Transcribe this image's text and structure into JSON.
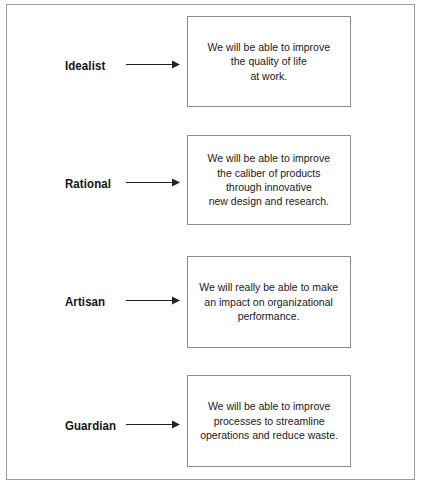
{
  "figure": {
    "width": 426,
    "height": 489,
    "background_color": "#ffffff",
    "frame_border_color": "#9a9a9a",
    "box_border_color": "#8d8d8d",
    "text_color": "#1a1a1a",
    "label_color": "#141414",
    "arrow_color": "#222222"
  },
  "rows": [
    {
      "label": "Idealist",
      "arrow_icon": "arrow-right-icon",
      "message": "We will be able to improve\nthe quality of life\nat work."
    },
    {
      "label": "Rational",
      "arrow_icon": "arrow-right-icon",
      "message": "We will be able to improve\nthe caliber of products\nthrough innovative\nnew design and research."
    },
    {
      "label": "Artisan",
      "arrow_icon": "arrow-right-icon",
      "message": "We will really be able to make\nan impact on organizational\nperformance."
    },
    {
      "label": "Guardian",
      "arrow_icon": "arrow-right-icon",
      "message": "We will be able to improve\nprocesses to streamline\noperations and reduce waste."
    }
  ]
}
